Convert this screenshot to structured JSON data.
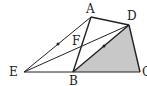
{
  "figure": {
    "type": "geometry-diagram",
    "points": {
      "A": "A",
      "B": "B",
      "C": "C",
      "D": "D",
      "E": "E",
      "F": "F"
    },
    "segments": [
      "EA",
      "ED",
      "EB",
      "BC",
      "AB",
      "AD",
      "DC",
      "BD"
    ],
    "shaded_region": "triangle BCD",
    "midpoint_marks": [
      "EA",
      "BD"
    ],
    "colors": {
      "line": "#222222",
      "shade": "#c8c8c8"
    }
  }
}
